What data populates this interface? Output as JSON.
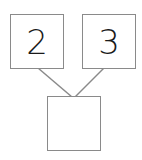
{
  "diagram": {
    "type": "number-bond",
    "parts": [
      {
        "label": "2"
      },
      {
        "label": "3"
      }
    ],
    "whole": {
      "label": ""
    },
    "colors": {
      "stroke": "#8a8a8a",
      "text": "#1a1a1a",
      "background": "#ffffff"
    }
  }
}
